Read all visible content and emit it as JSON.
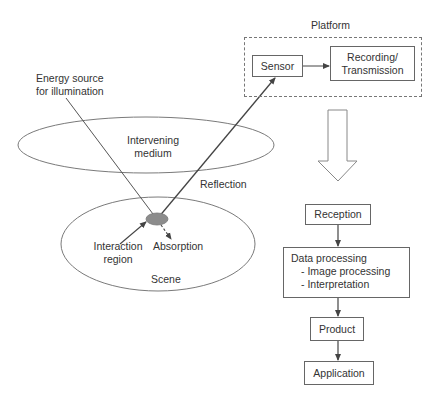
{
  "labels": {
    "energy_source": [
      "Energy source",
      "for illumination"
    ],
    "intervening_medium": [
      "Intervening",
      "medium"
    ],
    "reflection": "Reflection",
    "interaction_region": [
      "Interaction",
      "region"
    ],
    "absorption": "Absorption",
    "scene": "Scene",
    "platform": "Platform"
  },
  "platform": {
    "sensor": "Sensor",
    "recording": [
      "Recording/",
      "Transmission"
    ]
  },
  "pipeline": {
    "reception": "Reception",
    "data_processing": {
      "title": "Data processing",
      "items": [
        "- Image processing",
        "- Interpretation"
      ]
    },
    "product": "Product",
    "application": "Application"
  },
  "colors": {
    "line": "#555555",
    "interaction_fill": "#8c8c8c",
    "ellipse_stroke": "#7a7a7a"
  }
}
